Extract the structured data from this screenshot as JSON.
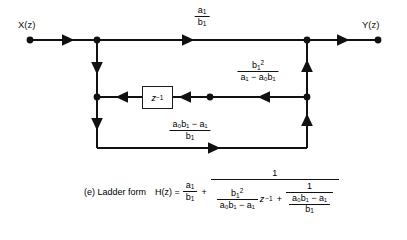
{
  "figure": {
    "caption_label": "(e) Ladder form",
    "transfer_lhs": "H(z) =",
    "input_label": "X(z)",
    "output_label": "Y(z)"
  },
  "blocks": {
    "delay": {
      "name": "unit-delay",
      "base": "z",
      "exponent": "−1"
    }
  },
  "gains": {
    "feedforward": {
      "numerator": "a",
      "numerator_sub": "1",
      "denominator": "b",
      "denominator_sub": "1",
      "text": "a1/b1"
    },
    "middle": {
      "numerator": "b",
      "numerator_sub": "1",
      "numerator_sup": "2",
      "denominator": "a₁ − a₀b₁",
      "text": "b1^2/(a1 - a0 b1)"
    },
    "feedback": {
      "numerator": "a₀b₁ − a₁",
      "denominator": "b",
      "denominator_sub": "1",
      "text": "(a0 b1 - a1)/b1"
    }
  },
  "equation": {
    "first_term": {
      "num": "a",
      "num_sub": "1",
      "den": "b",
      "den_sub": "1"
    },
    "plus_1": "+",
    "outer_numerator": "1",
    "inner_left": {
      "num": "b",
      "num_sub": "1",
      "num_sup": "2",
      "den": "a₀b₁ − a₁"
    },
    "z_base": "z",
    "z_exp": "−1",
    "plus_2": "+",
    "inner_right_num": "1",
    "inner_right_den": {
      "num": "a₀b₁ − a₁",
      "den": "b",
      "den_sub": "1"
    }
  },
  "style": {
    "line_color": "#111111",
    "background": "#ffffff"
  }
}
